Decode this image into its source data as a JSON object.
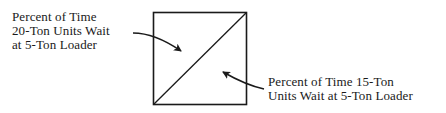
{
  "diagram": {
    "type": "divided-square",
    "labels": {
      "upper_left": {
        "lines": [
          "Percent of Time",
          "20-Ton Units Wait",
          "at 5-Ton Loader"
        ]
      },
      "lower_right": {
        "lines": [
          "Percent of Time 15-Ton",
          "Units Wait at 5-Ton Loader"
        ]
      }
    },
    "colors": {
      "line": "#1a1a1a",
      "background": "#ffffff"
    }
  }
}
